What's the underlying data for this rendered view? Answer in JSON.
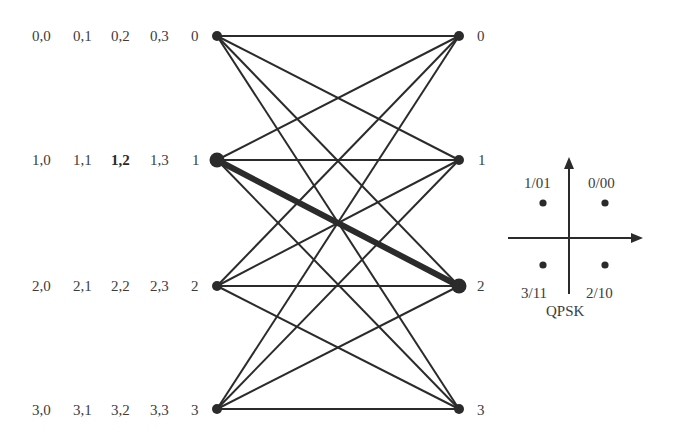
{
  "trellis": {
    "left_x": 217,
    "right_x": 459,
    "row_y": [
      36,
      160,
      286,
      409
    ],
    "edge_color": "#2b2b2b",
    "left_states": [
      {
        "id": "0",
        "labels": [
          "0,0",
          "0,1",
          "0,2",
          "0,3"
        ],
        "state": "0",
        "bold_index": -1
      },
      {
        "id": "1",
        "labels": [
          "1,0",
          "1,1",
          "1,2",
          "1,3"
        ],
        "state": "1",
        "bold_index": 2
      },
      {
        "id": "2",
        "labels": [
          "2,0",
          "2,1",
          "2,2",
          "2,3"
        ],
        "state": "2",
        "bold_index": -1
      },
      {
        "id": "3",
        "labels": [
          "3,0",
          "3,1",
          "3,2",
          "3,3"
        ],
        "state": "3",
        "bold_index": -1
      }
    ],
    "right_states": [
      "0",
      "1",
      "2",
      "3"
    ],
    "highlighted_edge": {
      "from": 1,
      "to": 2
    },
    "enlarged_nodes": {
      "left": [
        1
      ],
      "right": [
        2
      ]
    },
    "edges": "all 16 transitions (every left state to every right state)"
  },
  "qpsk": {
    "title": "QPSK",
    "center": [
      570,
      238
    ],
    "points": [
      {
        "label": "0/00",
        "quadrant": "upper-right"
      },
      {
        "label": "1/01",
        "quadrant": "upper-left"
      },
      {
        "label": "3/11",
        "quadrant": "lower-left"
      },
      {
        "label": "2/10",
        "quadrant": "lower-right"
      }
    ]
  }
}
